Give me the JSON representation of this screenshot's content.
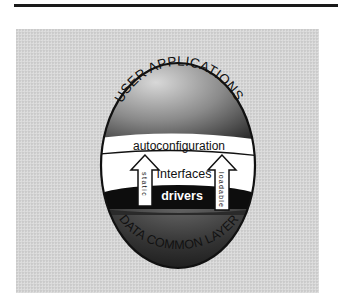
{
  "diagram": {
    "top_arc_label": "USER APPLICATIONS",
    "bottom_arc_label": "DATA COMMON LAYER",
    "band_label": "autoconfiguration",
    "center_label": "Interfaces",
    "lower_band_label": "drivers",
    "left_arrow_label": "static",
    "right_arrow_label": "loadable"
  },
  "colors": {
    "panel": "#d6d6d6",
    "egg_outline": "#111111",
    "white_band": "#ffffff",
    "drivers_band": "#0d0d0d"
  }
}
